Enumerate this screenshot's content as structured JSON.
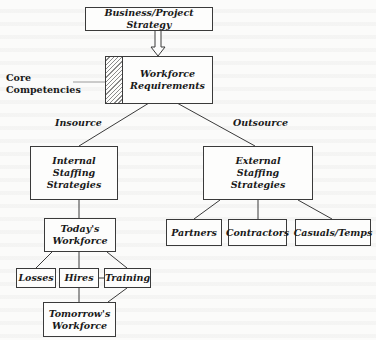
{
  "diagram": {
    "top": {
      "label": "Business/Project Strategy"
    },
    "requirements": {
      "label": "Workforce\nRequirements"
    },
    "core": {
      "label": "Core\nCompetencies"
    },
    "branches": {
      "left_label": "Insource",
      "right_label": "Outsource"
    },
    "internal": {
      "label": "Internal\nStaffing\nStrategies"
    },
    "external": {
      "label": "External\nStaffing\nStrategies"
    },
    "today": {
      "label": "Today's\nWorkforce"
    },
    "flows": [
      {
        "label": "Losses"
      },
      {
        "label": "Hires"
      },
      {
        "label": "Training"
      }
    ],
    "tomorrow": {
      "label": "Tomorrow's\nWorkforce"
    },
    "external_options": [
      {
        "label": "Partners"
      },
      {
        "label": "Contractors"
      },
      {
        "label": "Casuals/Temps"
      }
    ]
  }
}
